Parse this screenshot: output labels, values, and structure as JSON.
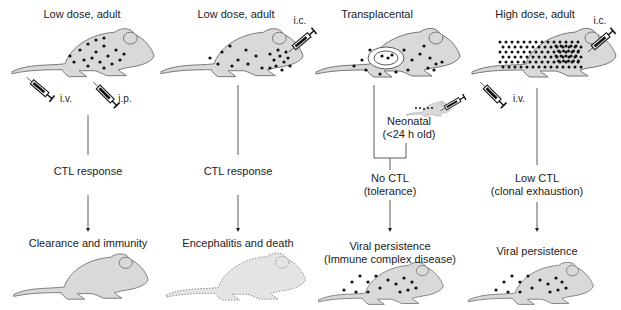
{
  "columns": [
    {
      "heading": "Low dose, adult",
      "routes": [
        "i.v.",
        "i.p."
      ],
      "response": [
        "CTL response"
      ],
      "outcome": [
        "Clearance and immunity"
      ],
      "virus_load": "low",
      "outcome_mouse": "cleared"
    },
    {
      "heading": "Low dose, adult",
      "routes": [
        "i.c."
      ],
      "response": [
        "CTL response"
      ],
      "outcome": [
        "Encephalitis and death"
      ],
      "virus_load": "low-brain",
      "outcome_mouse": "dead"
    },
    {
      "heading": "Transplacental",
      "routes": [],
      "neonatal": [
        "Neonatal",
        "(<24 h old)"
      ],
      "response": [
        "No CTL",
        "(tolerance)"
      ],
      "outcome": [
        "Viral persistence",
        "(Immune complex disease)"
      ],
      "virus_load": "transplacental",
      "outcome_mouse": "persistent"
    },
    {
      "heading": "High dose, adult",
      "routes": [
        "i.c.",
        "i.v."
      ],
      "response": [
        "Low CTL",
        "(clonal exhaustion)"
      ],
      "outcome": [
        "Viral persistence"
      ],
      "virus_load": "high",
      "outcome_mouse": "persistent"
    }
  ],
  "colors": {
    "mouse_fill": "#d9d9d9",
    "mouse_stroke": "#777777",
    "dot": "#111111",
    "line": "#333333"
  }
}
